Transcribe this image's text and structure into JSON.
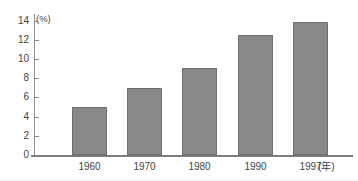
{
  "chart_data": {
    "type": "bar",
    "title": "",
    "title_note": "title row is cropped off at the top edge; only faint unreadable pixel remnants remain",
    "categories": [
      "1960",
      "1970",
      "1980",
      "1990",
      "1997"
    ],
    "values": [
      5.0,
      7.0,
      9.1,
      12.5,
      13.9
    ],
    "series": [
      {
        "name": "",
        "values": [
          5.0,
          7.0,
          9.1,
          12.5,
          13.9
        ]
      }
    ],
    "xlabel": "(年)",
    "ylabel": "(%)",
    "ylim": [
      0,
      14.7
    ],
    "yticks": [
      0,
      2,
      4,
      6,
      8,
      10,
      12,
      14
    ],
    "ytick_labels": [
      "0",
      "2",
      "4",
      "6",
      "8",
      "10",
      "12",
      "14"
    ],
    "grid": false,
    "legend": false,
    "bar_color": "#898989",
    "bar_edge_color": "#6f6f6f",
    "axis_color": "#8c8c8c",
    "background": "#ffffff"
  },
  "axes": {
    "y_unit_label": "(%)",
    "x_unit_label": "(年)"
  },
  "title": {
    "visible_text": ""
  }
}
